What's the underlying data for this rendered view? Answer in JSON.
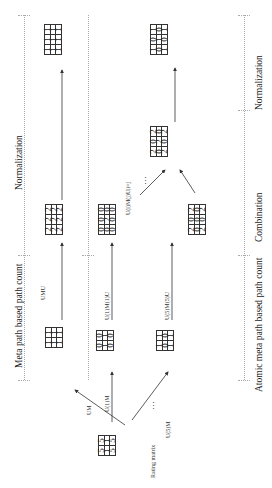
{
  "sections": {
    "meta_path": "Meta path based path count",
    "atomic": "Atomic meta path based path count",
    "combination": "Combination",
    "normalization_top": "Normalization",
    "normalization_bottom": "Normalization"
  },
  "operations": {
    "um": "UM",
    "umu": "UMU",
    "u1m": "U(1)M",
    "u1mu": "U(1)M(1)U",
    "u5m": "U(5)M",
    "u5mu": "U(5)M(5)U",
    "combine": "U(i)M(j)U|i=j",
    "ellipsis": "…"
  },
  "rating_matrix": {
    "label": "Rating matrix",
    "cols": [
      "m₁",
      "m₂"
    ],
    "rows": [
      "u₁",
      "u₂",
      "u₃"
    ],
    "values": [
      [
        "5",
        "5"
      ],
      [
        "1",
        "1"
      ],
      [
        "5",
        "5"
      ]
    ]
  },
  "matrices": {
    "um": {
      "cols": [
        "m₁",
        "m₂"
      ],
      "rows": [
        "u₁",
        "u₂",
        "u₃"
      ],
      "values": [
        [
          "1",
          "1"
        ],
        [
          "1",
          "1"
        ],
        [
          "1",
          "1"
        ]
      ]
    },
    "u1m": {
      "cols": [
        "m₁",
        "m₂"
      ],
      "rows": [
        "u₁",
        "u₂",
        "u₃"
      ],
      "values": [
        [
          "0",
          "0"
        ],
        [
          "1",
          "1"
        ],
        [
          "0",
          "0"
        ]
      ]
    },
    "u5m": {
      "cols": [
        "m₁",
        "m₂"
      ],
      "rows": [
        "u₁",
        "u₂",
        "u₃"
      ],
      "values": [
        [
          "1",
          "1"
        ],
        [
          "0",
          "0"
        ],
        [
          "1",
          "1"
        ]
      ]
    },
    "umu": {
      "cols": [
        "u₁",
        "u₂",
        "u₃"
      ],
      "rows": [
        "u₁",
        "u₂",
        "u₃"
      ],
      "values": [
        [
          "2",
          "2",
          "2"
        ],
        [
          "2",
          "2",
          "2"
        ],
        [
          "2",
          "2",
          "2"
        ]
      ]
    },
    "u1mu": {
      "cols": [
        "u₁",
        "u₂",
        "u₃"
      ],
      "rows": [
        "u₁",
        "u₂",
        "u₃"
      ],
      "values": [
        [
          "0",
          "0",
          "0"
        ],
        [
          "0",
          "2",
          "0"
        ],
        [
          "0",
          "0",
          "0"
        ]
      ]
    },
    "u5mu": {
      "cols": [
        "u₁",
        "u₂",
        "u₃"
      ],
      "rows": [
        "u₁",
        "u₂",
        "u₃"
      ],
      "values": [
        [
          "2",
          "0",
          "2"
        ],
        [
          "0",
          "0",
          "0"
        ],
        [
          "2",
          "0",
          "2"
        ]
      ]
    },
    "combined": {
      "cols": [
        "u₁",
        "u₂",
        "u₃"
      ],
      "rows": [
        "u₁",
        "u₂",
        "u₃"
      ],
      "values": [
        [
          "2",
          "0",
          "2"
        ],
        [
          "0",
          "2",
          "0"
        ],
        [
          "2",
          "0",
          "2"
        ]
      ]
    },
    "norm_meta": {
      "cols": [
        "u₁",
        "u₂",
        "u₃"
      ],
      "rows": [
        "u₁",
        "u₂",
        "u₃"
      ],
      "values": [
        [
          "1",
          "1",
          "1"
        ],
        [
          "1",
          "1",
          "1"
        ],
        [
          "1",
          "1",
          "1"
        ]
      ]
    },
    "norm_atomic": {
      "cols": [
        "u₁",
        "u₂",
        "u₃"
      ],
      "rows": [
        "u₁",
        "u₂",
        "u₃"
      ],
      "values": [
        [
          "1",
          "0",
          "1"
        ],
        [
          "0",
          "1",
          "0"
        ],
        [
          "1",
          "0",
          "1"
        ]
      ]
    }
  }
}
